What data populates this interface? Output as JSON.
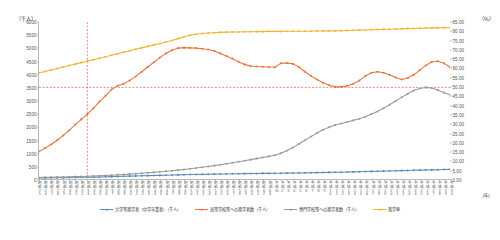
{
  "chart_data": {
    "type": "line",
    "title": "",
    "ylabel": "（千人）",
    "ylabel_right": "（％）",
    "xlabel": "（年）",
    "ylim": [
      0,
      6000
    ],
    "ylim_right": [
      0.0,
      85.0
    ],
    "grid": false,
    "legend_position": "bottom",
    "y_ticks": [
      "0",
      "500",
      "1000",
      "1500",
      "2000",
      "2500",
      "3000",
      "3500",
      "4000",
      "4500",
      "5000",
      "5500",
      "6000"
    ],
    "y_ticks_right": [
      "0.00",
      "5.00",
      "10.00",
      "15.00",
      "20.00",
      "25.00",
      "30.00",
      "35.00",
      "40.00",
      "45.00",
      "50.00",
      "55.00",
      "60.00",
      "65.00",
      "70.00",
      "75.00",
      "80.00",
      "85.00"
    ],
    "categories": [
      "昭和25",
      "昭和26",
      "昭和27",
      "昭和28",
      "昭和29",
      "昭和30",
      "昭和31",
      "昭和32",
      "昭和33",
      "昭和34",
      "昭和35",
      "昭和36",
      "昭和37",
      "昭和38",
      "昭和39",
      "昭和40",
      "昭和41",
      "昭和42",
      "昭和43",
      "昭和44",
      "昭和45",
      "昭和46",
      "昭和47",
      "昭和48",
      "昭和49",
      "昭和50",
      "昭和51",
      "昭和52",
      "昭和53",
      "昭和54",
      "昭和55",
      "昭和56",
      "昭和57",
      "昭和58",
      "昭和59",
      "昭和60",
      "昭和61",
      "昭和62",
      "昭和63",
      "平成元",
      "平成2",
      "平成3",
      "平成4",
      "平成5",
      "平成6",
      "平成7",
      "平成8",
      "平成9",
      "平成10",
      "平成11",
      "平成12",
      "平成13",
      "平成14",
      "平成15",
      "平成16",
      "平成17",
      "平成18",
      "平成19",
      "平成20",
      "平成21",
      "平成22",
      "平成23",
      "平成24",
      "平成25",
      "平成26",
      "平成27",
      "平成28",
      "平成29",
      "平成30"
    ],
    "series": [
      {
        "name": "大学等進学者（中学卒業者）（千人）",
        "color": "#5B8DB8",
        "axis": "left",
        "values": [
          40,
          42,
          45,
          48,
          52,
          56,
          60,
          64,
          68,
          72,
          78,
          84,
          90,
          96,
          102,
          110,
          116,
          122,
          128,
          134,
          140,
          146,
          152,
          158,
          164,
          170,
          174,
          178,
          182,
          186,
          190,
          194,
          198,
          202,
          206,
          210,
          212,
          214,
          216,
          218,
          220,
          224,
          228,
          232,
          236,
          240,
          244,
          248,
          252,
          256,
          260,
          266,
          272,
          278,
          284,
          290,
          296,
          302,
          308,
          314,
          320,
          326,
          332,
          338,
          344,
          350,
          356,
          362,
          368
        ]
      },
      {
        "name": "高等学校等への進学者数（千人）",
        "color": "#E8743B",
        "axis": "left",
        "values": [
          1050,
          1180,
          1320,
          1480,
          1660,
          1860,
          2080,
          2280,
          2480,
          2700,
          2960,
          3180,
          3420,
          3560,
          3640,
          3760,
          3920,
          4100,
          4280,
          4460,
          4640,
          4800,
          4920,
          5000,
          5020,
          5010,
          5000,
          4980,
          4950,
          4890,
          4800,
          4700,
          4600,
          4480,
          4380,
          4320,
          4300,
          4290,
          4280,
          4270,
          4420,
          4430,
          4400,
          4280,
          4100,
          3940,
          3800,
          3680,
          3580,
          3520,
          3520,
          3560,
          3640,
          3760,
          3940,
          4060,
          4100,
          4060,
          3980,
          3880,
          3800,
          3860,
          3980,
          4160,
          4340,
          4480,
          4500,
          4420,
          4280
        ]
      },
      {
        "name": "専門学校等への進学者数（千人）",
        "color": "#9B9B9B",
        "axis": "left",
        "values": [
          60,
          64,
          68,
          72,
          78,
          84,
          90,
          98,
          106,
          114,
          124,
          134,
          146,
          158,
          172,
          186,
          202,
          218,
          236,
          254,
          274,
          294,
          316,
          340,
          366,
          394,
          420,
          448,
          478,
          510,
          544,
          580,
          620,
          662,
          700,
          740,
          780,
          820,
          864,
          910,
          980,
          1080,
          1200,
          1340,
          1480,
          1620,
          1760,
          1880,
          1980,
          2060,
          2120,
          2180,
          2240,
          2300,
          2380,
          2480,
          2580,
          2700,
          2840,
          2980,
          3120,
          3260,
          3380,
          3460,
          3500,
          3480,
          3400,
          3300,
          3220
        ]
      },
      {
        "name": "進学率",
        "color": "#F2B431",
        "axis": "right",
        "values": [
          57.5,
          58.2,
          59.0,
          59.8,
          60.6,
          61.4,
          62.2,
          63.0,
          63.8,
          64.6,
          65.4,
          66.2,
          67.0,
          67.8,
          68.6,
          69.4,
          70.2,
          71.0,
          71.8,
          72.6,
          73.4,
          74.2,
          75.0,
          76.0,
          77.0,
          77.8,
          78.4,
          78.8,
          79.0,
          79.2,
          79.4,
          79.5,
          79.6,
          79.6,
          79.7,
          79.7,
          79.8,
          79.8,
          79.9,
          79.9,
          79.9,
          80.0,
          80.0,
          80.0,
          80.0,
          80.0,
          80.1,
          80.1,
          80.2,
          80.2,
          80.3,
          80.4,
          80.5,
          80.6,
          80.7,
          80.8,
          80.9,
          81.0,
          81.1,
          81.2,
          81.3,
          81.4,
          81.5,
          81.6,
          81.7,
          81.8,
          81.8,
          81.9,
          81.9
        ]
      }
    ],
    "annotations": {
      "reference_vline_category": "昭和33",
      "reference_hline_value": 3500,
      "reference_color": "#E03A2F"
    }
  },
  "legend": {
    "items": [
      {
        "label": "大学等進学者（中学卒業者）（千人）",
        "color": "#5B8DB8"
      },
      {
        "label": "高等学校等への進学者数（千人）",
        "color": "#E8743B"
      },
      {
        "label": "専門学校等への進学者数（千人）",
        "color": "#9B9B9B"
      },
      {
        "label": "進学率",
        "color": "#F2B431"
      }
    ]
  }
}
